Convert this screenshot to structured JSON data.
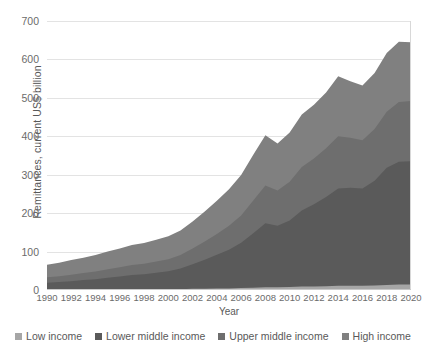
{
  "chart_data": {
    "type": "area",
    "stacked": true,
    "title": "",
    "xlabel": "Year",
    "ylabel": "Remittances, current US$ billion",
    "x": [
      1990,
      1991,
      1992,
      1993,
      1994,
      1995,
      1996,
      1997,
      1998,
      1999,
      2000,
      2001,
      2002,
      2003,
      2004,
      2005,
      2006,
      2007,
      2008,
      2009,
      2010,
      2011,
      2012,
      2013,
      2014,
      2015,
      2016,
      2017,
      2018,
      2019,
      2020
    ],
    "xtick_labels": [
      "1990",
      "1992",
      "1994",
      "1996",
      "1998",
      "2000",
      "2002",
      "2004",
      "2006",
      "2008",
      "2010",
      "2012",
      "2014",
      "2016",
      "2018",
      "2020"
    ],
    "ytick_labels": [
      "0",
      "100",
      "200",
      "300",
      "400",
      "500",
      "600",
      "700"
    ],
    "ylim": [
      0,
      700
    ],
    "xlim": [
      1990,
      2020
    ],
    "grid": true,
    "legend_position": "bottom",
    "series": [
      {
        "name": "Low income",
        "color": "#a6a6a6",
        "values": [
          1,
          1,
          1,
          1,
          1,
          2,
          2,
          2,
          2,
          2,
          2,
          2,
          3,
          3,
          4,
          4,
          5,
          6,
          7,
          7,
          8,
          9,
          9,
          10,
          11,
          11,
          11,
          12,
          13,
          14,
          14
        ]
      },
      {
        "name": "Lower middle income",
        "color": "#5a5a5a",
        "values": [
          18,
          20,
          22,
          25,
          27,
          30,
          33,
          37,
          39,
          43,
          47,
          54,
          64,
          76,
          88,
          101,
          118,
          142,
          167,
          160,
          173,
          198,
          214,
          232,
          253,
          255,
          253,
          272,
          305,
          320,
          321
        ]
      },
      {
        "name": "Upper middle income",
        "color": "#6e6e6e",
        "values": [
          14,
          15,
          17,
          18,
          20,
          22,
          24,
          26,
          27,
          29,
          31,
          35,
          41,
          47,
          54,
          62,
          71,
          85,
          98,
          92,
          101,
          113,
          119,
          127,
          136,
          130,
          126,
          135,
          146,
          155,
          157
        ]
      },
      {
        "name": "High income",
        "color": "#808080",
        "values": [
          33,
          35,
          38,
          40,
          43,
          46,
          49,
          52,
          54,
          57,
          60,
          64,
          70,
          78,
          86,
          95,
          105,
          119,
          131,
          122,
          128,
          137,
          140,
          145,
          156,
          147,
          142,
          146,
          153,
          157,
          153
        ]
      }
    ]
  },
  "axes": {
    "y_title": "Remittances, current US$ billion",
    "x_title": "Year"
  },
  "legend": {
    "items": [
      {
        "label": "Low income",
        "color": "#a6a6a6"
      },
      {
        "label": "Lower middle income",
        "color": "#5a5a5a"
      },
      {
        "label": "Upper middle income",
        "color": "#6e6e6e"
      },
      {
        "label": "High income",
        "color": "#808080"
      }
    ]
  }
}
